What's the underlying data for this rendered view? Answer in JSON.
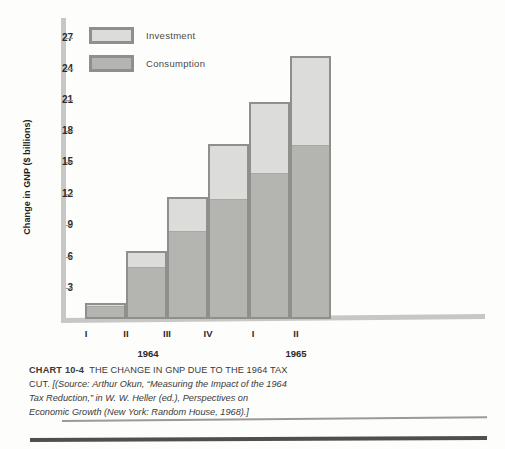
{
  "chart_data": {
    "type": "bar",
    "stacked": true,
    "title": "THE CHANGE IN GNP DUE TO THE 1964 TAX CUT.",
    "chart_number": "CHART 10-4",
    "xlabel": "",
    "ylabel": "Change in GNP ($ billions)",
    "ylim": [
      0,
      28.5
    ],
    "yticks": [
      3,
      6,
      9,
      12,
      15,
      18,
      21,
      24,
      27
    ],
    "ytick_labels": [
      "3",
      "6",
      "9",
      "12",
      "15",
      "18",
      "21",
      "24",
      "27"
    ],
    "grid": false,
    "legend_position": "top-left",
    "categories": [
      "I",
      "II",
      "III",
      "IV",
      "I",
      "II"
    ],
    "groups": [
      {
        "label": "1964",
        "categories": [
          "I",
          "II",
          "III",
          "IV"
        ]
      },
      {
        "label": "1965",
        "categories": [
          "I",
          "II"
        ]
      }
    ],
    "series": [
      {
        "name": "Consumption",
        "color": "#b4b4b1",
        "values": [
          1.5,
          5.2,
          8.7,
          11.8,
          14.4,
          17.1
        ]
      },
      {
        "name": "Investment",
        "color": "#dcdcda",
        "values": [
          0.1,
          1.4,
          3.1,
          5.2,
          6.7,
          8.4
        ]
      }
    ],
    "totals": [
      1.6,
      6.6,
      11.8,
      17.0,
      21.1,
      25.5
    ]
  },
  "legend": {
    "items": [
      {
        "label": "Investment",
        "swatch": "investment"
      },
      {
        "label": "Consumption",
        "swatch": "consumption"
      }
    ]
  },
  "axis": {
    "y_title": "Change in GNP ($ billions)",
    "y_ticks": [
      "27",
      "24",
      "21",
      "18",
      "15",
      "12",
      "9",
      "6",
      "3"
    ],
    "x_ticks": [
      "I",
      "II",
      "III",
      "IV",
      "I",
      "II"
    ],
    "x_groups": [
      "1964",
      "1965"
    ]
  },
  "caption": {
    "chart_number": "CHART 10-4",
    "headline": "THE CHANGE IN GNP DUE TO THE 1964 TAX CUT.",
    "source_open": "[(Source:",
    "source_text": "Arthur Okun, “Measuring the Impact of the 1964 Tax Reduction,” in W. W. Heller (ed.), Perspectives on Economic Growth (New York: Random House, 1968).]"
  },
  "colors": {
    "investment": "#dcdcda",
    "consumption": "#b4b4b1",
    "bar_border": "#8f8f8d",
    "axis": "#c7c7c5",
    "text": "#2b2b2b"
  }
}
